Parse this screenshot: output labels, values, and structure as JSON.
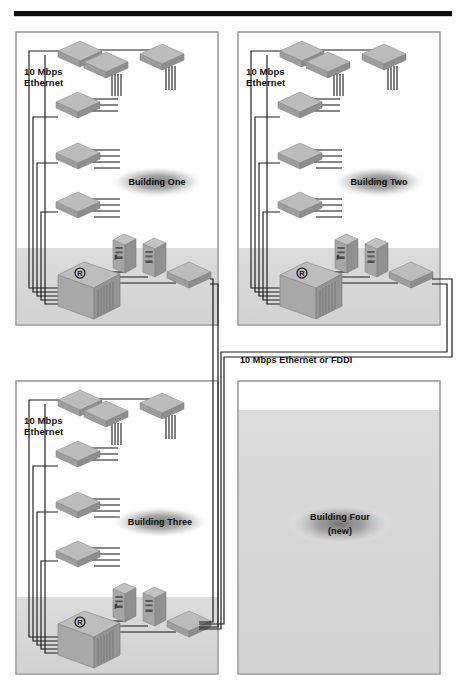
{
  "diagram": {
    "top_rule": {
      "name": "horizontal-rule",
      "color": "#000000"
    },
    "backbone_label": "10 Mbps Ethernet or FDDI",
    "colors": {
      "rule": "#0d0d0d",
      "box_border": "#9a9a9a",
      "floor_band": "#d9d9d9",
      "device_top": "#b9b9b9",
      "device_left": "#9a9a9a",
      "device_right": "#8c8c8c",
      "cable": "#1a1a1a",
      "label_text": "#101010",
      "shadow_ellipse": "#8a8a8a",
      "page_background": "#ffffff"
    },
    "buildings": [
      {
        "id": "building-one",
        "name": "Building One",
        "label": "Building One",
        "sublabel": "",
        "link_label": "10 Mbps\nEthernet",
        "link_speed": "10 Mbps",
        "link_media": "Ethernet",
        "position": "top-left",
        "equipped": true,
        "hub_count": 6,
        "server_count": 2,
        "router_count": 1,
        "router_badge": "R"
      },
      {
        "id": "building-two",
        "name": "Building Two",
        "label": "Building Two",
        "sublabel": "",
        "link_label": "10 Mbps\nEthernet",
        "link_speed": "10 Mbps",
        "link_media": "Ethernet",
        "position": "top-right",
        "equipped": true,
        "hub_count": 6,
        "server_count": 2,
        "router_count": 1,
        "router_badge": "R"
      },
      {
        "id": "building-three",
        "name": "Building Three",
        "label": "Building Three",
        "sublabel": "",
        "link_label": "10 Mbps\nEthernet",
        "link_speed": "10 Mbps",
        "link_media": "Ethernet",
        "position": "bottom-left",
        "equipped": true,
        "hub_count": 6,
        "server_count": 2,
        "router_count": 1,
        "router_badge": "R"
      },
      {
        "id": "building-four",
        "name": "Building Four",
        "label": "Building Four",
        "sublabel": "(new)",
        "link_label": "",
        "link_speed": "",
        "link_media": "",
        "position": "bottom-right",
        "equipped": false,
        "hub_count": 0,
        "server_count": 0,
        "router_count": 0,
        "router_badge": ""
      }
    ]
  }
}
